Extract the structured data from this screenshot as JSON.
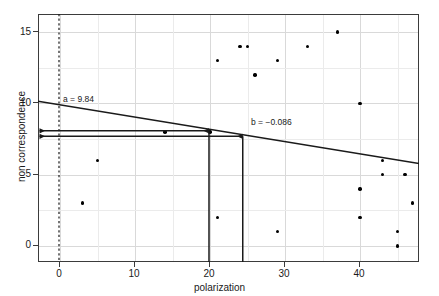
{
  "chart_data": {
    "type": "scatter",
    "title": "",
    "xlabel": "polarization",
    "ylabel": "non correspondence",
    "xlim": [
      -2.8,
      48
    ],
    "ylim": [
      -1.2,
      16.2
    ],
    "xticks": [
      0,
      10,
      20,
      30,
      40
    ],
    "yticks": [
      0,
      5,
      10,
      15
    ],
    "grid": true,
    "legend": null,
    "points": [
      {
        "x": 3,
        "y": 3
      },
      {
        "x": 5,
        "y": 6
      },
      {
        "x": 14,
        "y": 8
      },
      {
        "x": 20,
        "y": 8
      },
      {
        "x": 21,
        "y": 13
      },
      {
        "x": 21,
        "y": 2
      },
      {
        "x": 24,
        "y": 14
      },
      {
        "x": 25,
        "y": 14
      },
      {
        "x": 26,
        "y": 12
      },
      {
        "x": 29,
        "y": 13
      },
      {
        "x": 29,
        "y": 1
      },
      {
        "x": 33,
        "y": 14
      },
      {
        "x": 37,
        "y": 15
      },
      {
        "x": 40,
        "y": 10
      },
      {
        "x": 40,
        "y": 4
      },
      {
        "x": 40,
        "y": 2
      },
      {
        "x": 43,
        "y": 6
      },
      {
        "x": 43,
        "y": 5
      },
      {
        "x": 45,
        "y": 1
      },
      {
        "x": 45,
        "y": 0
      },
      {
        "x": 46,
        "y": 5
      },
      {
        "x": 47,
        "y": 3
      }
    ],
    "regression": {
      "intercept": 9.84,
      "slope": -0.086,
      "intercept_label": "a = 9.84",
      "slope_label": "b = −0.086"
    },
    "reference_line": {
      "type": "vertical-dashed",
      "x": 0
    },
    "guides": {
      "horizontal_arrows": [
        {
          "y": 8.0,
          "from_x": 20.0,
          "to_x": -2.6
        },
        {
          "y": 7.62,
          "from_x": 24.5,
          "to_x": -2.6
        }
      ],
      "vertical_arrows": [
        {
          "x": 20.0,
          "from_y": -1.2,
          "to_y": 8.0
        },
        {
          "x": 24.5,
          "from_y": -1.2,
          "to_y": 7.62
        }
      ]
    }
  }
}
